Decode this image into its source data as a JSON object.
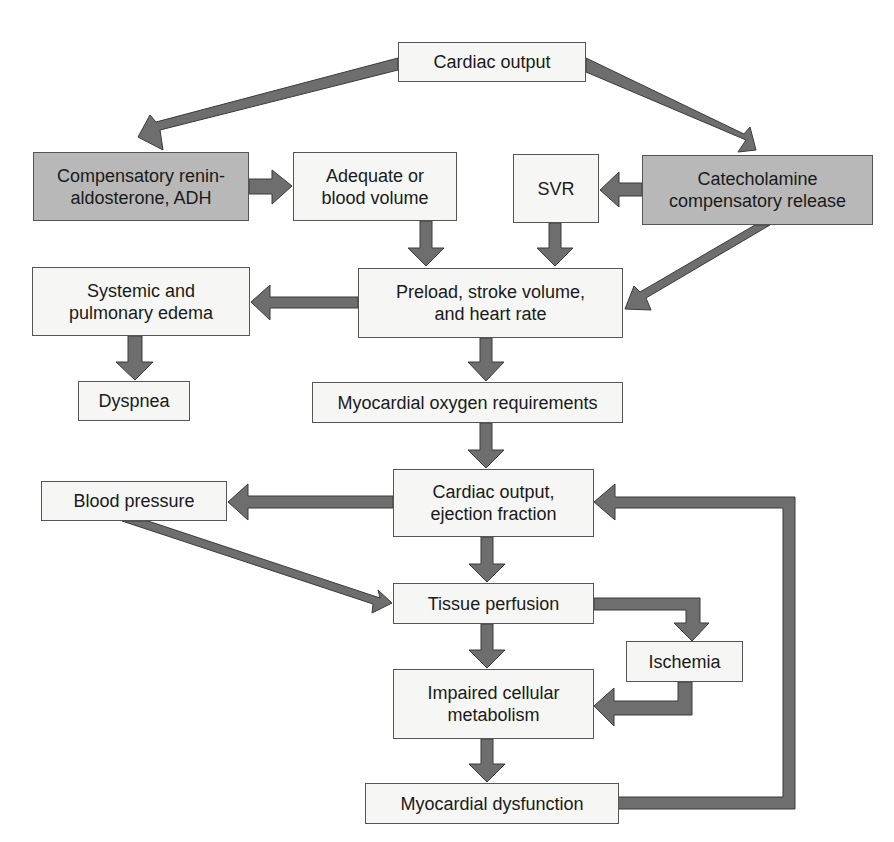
{
  "diagram": {
    "colors": {
      "arrow": "#6e6e6e",
      "arrow_edge": "#3a3a3a",
      "box_fill": "#f6f6f4",
      "box_shaded": "#b8b8b8",
      "box_border": "#555555"
    },
    "nodes": {
      "cardiac_output_top": {
        "label": "Cardiac output"
      },
      "renin": {
        "label": "Compensatory renin-\naldosterone, ADH"
      },
      "blood_volume": {
        "label": "Adequate or\nblood volume"
      },
      "svr": {
        "label": "SVR"
      },
      "catecholamine": {
        "label": "Catecholamine\ncompensatory release"
      },
      "edema": {
        "label": "Systemic and\npulmonary edema"
      },
      "preload": {
        "label": "Preload, stroke volume,\nand heart rate"
      },
      "dyspnea": {
        "label": "Dyspnea"
      },
      "myo_oxygen": {
        "label": "Myocardial oxygen requirements"
      },
      "cardiac_output_ef": {
        "label": "Cardiac output,\nejection fraction"
      },
      "blood_pressure": {
        "label": "Blood pressure"
      },
      "tissue_perfusion": {
        "label": "Tissue perfusion"
      },
      "ischemia": {
        "label": "Ischemia"
      },
      "impaired_metabolism": {
        "label": "Impaired cellular\nmetabolism"
      },
      "myo_dysfunction": {
        "label": "Myocardial dysfunction"
      }
    },
    "edges": [
      [
        "cardiac_output_top",
        "renin"
      ],
      [
        "cardiac_output_top",
        "catecholamine"
      ],
      [
        "renin",
        "blood_volume"
      ],
      [
        "catecholamine",
        "svr"
      ],
      [
        "catecholamine",
        "preload"
      ],
      [
        "blood_volume",
        "preload"
      ],
      [
        "svr",
        "preload"
      ],
      [
        "preload",
        "edema"
      ],
      [
        "edema",
        "dyspnea"
      ],
      [
        "preload",
        "myo_oxygen"
      ],
      [
        "myo_oxygen",
        "cardiac_output_ef"
      ],
      [
        "cardiac_output_ef",
        "blood_pressure"
      ],
      [
        "blood_pressure",
        "tissue_perfusion"
      ],
      [
        "cardiac_output_ef",
        "tissue_perfusion"
      ],
      [
        "tissue_perfusion",
        "ischemia"
      ],
      [
        "tissue_perfusion",
        "impaired_metabolism"
      ],
      [
        "ischemia",
        "impaired_metabolism"
      ],
      [
        "impaired_metabolism",
        "myo_dysfunction"
      ],
      [
        "myo_dysfunction",
        "cardiac_output_ef"
      ]
    ]
  }
}
